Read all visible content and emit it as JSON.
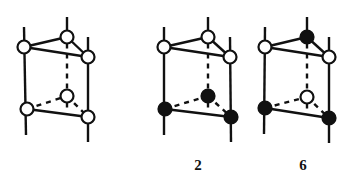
{
  "figures": [
    {
      "label": "",
      "sites": {
        "top_left": "open",
        "top_back": "open",
        "top_right": "open",
        "bottom_left": "open",
        "bottom_back": "open",
        "bottom_right": "open"
      }
    },
    {
      "label": "2",
      "sites": {
        "top_left": "open",
        "top_back": "open",
        "top_right": "open",
        "bottom_left": "filled",
        "bottom_back": "filled",
        "bottom_right": "filled"
      }
    },
    {
      "label": "6",
      "sites": {
        "top_left": "open",
        "top_back": "filled",
        "top_right": "open",
        "bottom_left": "filled",
        "bottom_back": "open",
        "bottom_right": "filled"
      }
    }
  ],
  "colors": {
    "line": "#111111",
    "open_fill": "#ffffff",
    "filled_fill": "#111111"
  }
}
